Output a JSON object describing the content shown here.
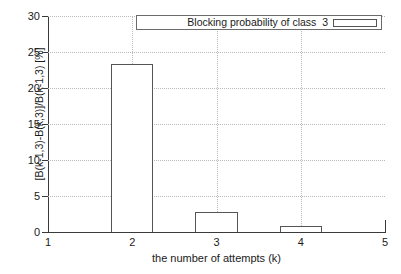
{
  "chart_data": {
    "type": "bar",
    "title": "",
    "subtitle": "",
    "xlabel": "the number of attempts (k)",
    "ylabel": "[B(k-1,3)-B(k,3)]/B(k-1,3) [%]",
    "x": [
      2,
      3,
      4
    ],
    "values": [
      23.4,
      2.8,
      0.8
    ],
    "series": [
      {
        "name": "Blocking probability of class  3",
        "values": [
          23.4,
          2.8,
          0.8
        ]
      }
    ],
    "bar_width": 0.5,
    "xlim": [
      1,
      5
    ],
    "ylim": [
      0,
      30
    ],
    "xticks": [
      "1",
      "2",
      "3",
      "4",
      "5"
    ],
    "xtick_values": [
      1,
      2,
      3,
      4,
      5
    ],
    "yticks": [
      "0",
      "5",
      "10",
      "15",
      "20",
      "25",
      "30"
    ],
    "ytick_values": [
      0,
      5,
      10,
      15,
      20,
      25,
      30
    ],
    "grid": true,
    "grid_style": "dotted",
    "legend": [
      "Blocking probability of class  3"
    ],
    "legend_position": "top-right-inside",
    "colors": {
      "bar_fill": "#ffffff",
      "bar_border": "#555555",
      "axis": "#3a3a3a",
      "grid": "#b9b9b9",
      "text": "#1a1a1a",
      "background": "#ffffff"
    }
  },
  "legend": {
    "entry_label": "Blocking probability of class  3",
    "swatch_name": "box-swatch"
  }
}
